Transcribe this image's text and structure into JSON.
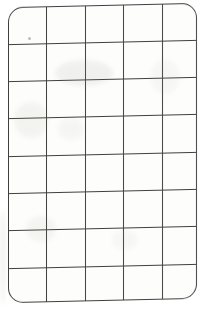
{
  "document": {
    "description": "Scanned blank grid table on white paper with rounded corners, no text content",
    "background_color": "#ffffff"
  },
  "grid_card": {
    "rows": 8,
    "columns": 5,
    "cell_count": 40,
    "line_color": "#3f3f3f",
    "paper_color": "#fdfdfb",
    "border_radius_px": 15,
    "cells_empty": true
  },
  "smudges": [
    {
      "kind": "speck",
      "x": 28,
      "y": 37,
      "w": 3,
      "h": 3,
      "opacity": 0.55
    },
    {
      "kind": "pencil",
      "x": 55,
      "y": 60,
      "w": 58,
      "h": 26,
      "opacity": 0.1
    },
    {
      "kind": "pencil",
      "x": 14,
      "y": 102,
      "w": 34,
      "h": 36,
      "opacity": 0.08
    },
    {
      "kind": "pencil",
      "x": 58,
      "y": 118,
      "w": 26,
      "h": 22,
      "opacity": 0.06
    },
    {
      "kind": "pencil",
      "x": 26,
      "y": 216,
      "w": 30,
      "h": 26,
      "opacity": 0.07
    },
    {
      "kind": "pencil",
      "x": 150,
      "y": 60,
      "w": 30,
      "h": 34,
      "opacity": 0.05
    },
    {
      "kind": "pencil",
      "x": 0,
      "y": 210,
      "w": 6,
      "h": 95,
      "opacity": 0.1
    },
    {
      "kind": "pencil",
      "x": 112,
      "y": 230,
      "w": 26,
      "h": 20,
      "opacity": 0.05
    }
  ]
}
